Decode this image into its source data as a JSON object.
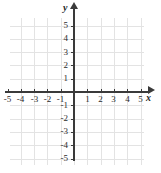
{
  "chart_data": {
    "type": "scatter",
    "title": "",
    "subtitle": "",
    "xlabel": "x",
    "ylabel": "y",
    "xlim": [
      -5.5,
      5.5
    ],
    "ylim": [
      -5.5,
      5.5
    ],
    "grid": true,
    "legend": null,
    "series": [],
    "x_ticks": [
      -5,
      -4,
      -3,
      -2,
      -1,
      1,
      2,
      3,
      4,
      5
    ],
    "y_ticks": [
      -5,
      -4,
      -3,
      -2,
      -1,
      1,
      2,
      3,
      4,
      5
    ],
    "x_tick_labels": [
      "-5",
      "-4",
      "-3",
      "-2",
      "-1",
      "1",
      "2",
      "3",
      "4",
      "5"
    ],
    "y_tick_labels": [
      "-5",
      "-4",
      "-3",
      "-2",
      "-1",
      "1",
      "2",
      "3",
      "4",
      "5"
    ],
    "annotations": []
  },
  "axes": {
    "x_label": "x",
    "y_label": "y"
  },
  "ticks": {
    "x": [
      {
        "value": -5,
        "label": "-5"
      },
      {
        "value": -4,
        "label": "-4"
      },
      {
        "value": -3,
        "label": "-3"
      },
      {
        "value": -2,
        "label": "-2"
      },
      {
        "value": -1,
        "label": "-1"
      },
      {
        "value": 1,
        "label": "1"
      },
      {
        "value": 2,
        "label": "2"
      },
      {
        "value": 3,
        "label": "3"
      },
      {
        "value": 4,
        "label": "4"
      },
      {
        "value": 5,
        "label": "5"
      }
    ],
    "y": [
      {
        "value": 5,
        "label": "5"
      },
      {
        "value": 4,
        "label": "4"
      },
      {
        "value": 3,
        "label": "3"
      },
      {
        "value": 2,
        "label": "2"
      },
      {
        "value": 1,
        "label": "1"
      },
      {
        "value": -1,
        "label": "-1"
      },
      {
        "value": -2,
        "label": "-2"
      },
      {
        "value": -3,
        "label": "-3"
      },
      {
        "value": -4,
        "label": "-4"
      },
      {
        "value": -5,
        "label": "-5"
      }
    ]
  },
  "colors": {
    "grid": "#e3e3e3",
    "axis": "#3a3a3a",
    "label": "#2b2b2b",
    "background": "#ffffff"
  }
}
